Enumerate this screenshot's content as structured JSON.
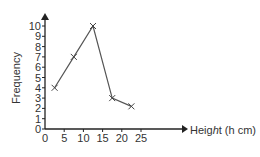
{
  "chart_data": {
    "type": "line",
    "title": "",
    "xlabel": "Height (h cm)",
    "ylabel": "Frequency",
    "x": [
      2.5,
      7.5,
      12.5,
      17.5,
      22.5
    ],
    "values": [
      4,
      7,
      10,
      3,
      2.2
    ],
    "x_ticks": [
      0,
      5,
      10,
      15,
      20,
      25
    ],
    "y_ticks": [
      0,
      1,
      2,
      3,
      4,
      5,
      6,
      7,
      8,
      9,
      10
    ],
    "xlim": [
      0,
      27
    ],
    "ylim": [
      0,
      11
    ],
    "grid": false,
    "marker": "x",
    "legend": null
  },
  "colors": {
    "line": "#555555",
    "axis": "#222222",
    "text": "#333333"
  }
}
